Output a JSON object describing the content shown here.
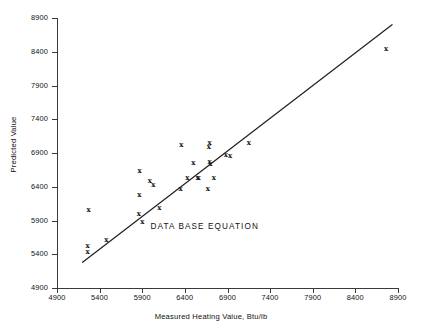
{
  "chart_data": {
    "type": "scatter",
    "title": "",
    "xlabel": "Measured Heating Value, Btu/lb",
    "ylabel": "Predicted Value",
    "xlim": [
      4900,
      8900
    ],
    "ylim": [
      4900,
      8900
    ],
    "xticks": [
      4900,
      5400,
      5900,
      6400,
      6900,
      7400,
      7900,
      8400,
      8900
    ],
    "yticks": [
      4900,
      5400,
      5900,
      6400,
      6900,
      7400,
      7900,
      8400,
      8900
    ],
    "xtick_labels": [
      "4900",
      "5400",
      "5900",
      "6400",
      "6900",
      "7400",
      "7900",
      "8400",
      "8900"
    ],
    "ytick_labels": [
      "4900",
      "5400",
      "5900",
      "6400",
      "6900",
      "7400",
      "7900",
      "8400",
      "8900"
    ],
    "grid": false,
    "legend": null,
    "marker": "x",
    "marker_color": "#111111",
    "annotations": [
      {
        "text": "DATA BASE EQUATION",
        "x": 6700,
        "y": 5800
      }
    ],
    "series": [
      {
        "name": "Observations",
        "marker": "x",
        "points": [
          {
            "x": 5260,
            "y": 5440
          },
          {
            "x": 5260,
            "y": 5530
          },
          {
            "x": 5270,
            "y": 6060
          },
          {
            "x": 5480,
            "y": 5620
          },
          {
            "x": 5860,
            "y": 6010
          },
          {
            "x": 5865,
            "y": 6280
          },
          {
            "x": 5870,
            "y": 6640
          },
          {
            "x": 5900,
            "y": 5880
          },
          {
            "x": 5990,
            "y": 6500
          },
          {
            "x": 6030,
            "y": 6430
          },
          {
            "x": 6100,
            "y": 6090
          },
          {
            "x": 6350,
            "y": 6380
          },
          {
            "x": 6360,
            "y": 7030
          },
          {
            "x": 6430,
            "y": 6530
          },
          {
            "x": 6500,
            "y": 6760
          },
          {
            "x": 6550,
            "y": 6540
          },
          {
            "x": 6560,
            "y": 6530
          },
          {
            "x": 6670,
            "y": 6380
          },
          {
            "x": 6680,
            "y": 6990
          },
          {
            "x": 6690,
            "y": 7050
          },
          {
            "x": 6690,
            "y": 6770
          },
          {
            "x": 6700,
            "y": 6750
          },
          {
            "x": 6740,
            "y": 6530
          },
          {
            "x": 6880,
            "y": 6880
          },
          {
            "x": 6930,
            "y": 6870
          },
          {
            "x": 7150,
            "y": 7060
          },
          {
            "x": 8760,
            "y": 8450
          }
        ]
      }
    ],
    "fit_line": {
      "name": "Data base equation",
      "x0": 5200,
      "y0": 5280,
      "x1": 8830,
      "y1": 8800,
      "color": "#222222"
    }
  }
}
